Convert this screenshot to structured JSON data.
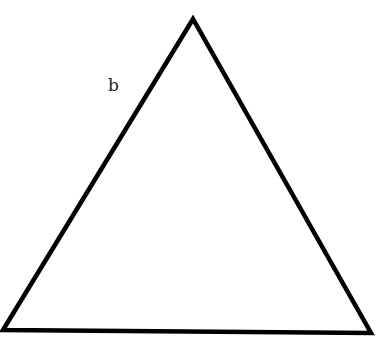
{
  "diagram": {
    "type": "triangle",
    "stroke_color": "#000000",
    "background_color": "#ffffff",
    "vertices": {
      "apex": {
        "x": 193,
        "y": 19
      },
      "bottom_left": {
        "x": 3,
        "y": 330
      },
      "bottom_right": {
        "x": 371,
        "y": 333
      }
    },
    "labels": [
      {
        "text": "b",
        "side": "left",
        "x": 108,
        "y": 77
      }
    ]
  }
}
